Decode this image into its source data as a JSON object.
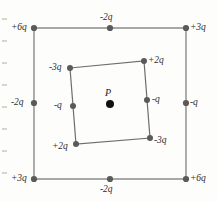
{
  "figure": {
    "center_point_label": "P",
    "colors": {
      "line": "#8a8a8a",
      "inner_line": "#6e6e6e",
      "dot": "#5a5a5a",
      "center_dot": "#111111",
      "label": "#2e2e2e",
      "background": "#fdfdfc"
    },
    "outer_square": {
      "name": "outer-square",
      "charges": [
        {
          "id": "outer-top-left",
          "label": "+6q",
          "cx": 34,
          "cy": 28,
          "lx": 11,
          "ly": 23
        },
        {
          "id": "outer-top-mid",
          "label": "-2q",
          "cx": 110,
          "cy": 28,
          "lx": 100,
          "ly": 13
        },
        {
          "id": "outer-top-right",
          "label": "+3q",
          "cx": 186,
          "cy": 28,
          "lx": 190,
          "ly": 23
        },
        {
          "id": "outer-left-mid",
          "label": "-2q",
          "cx": 34,
          "cy": 103,
          "lx": 11,
          "ly": 98
        },
        {
          "id": "outer-right-mid",
          "label": "-q",
          "cx": 186,
          "cy": 103,
          "lx": 190,
          "ly": 98
        },
        {
          "id": "outer-bottom-left",
          "label": "+3q",
          "cx": 34,
          "cy": 179,
          "lx": 11,
          "ly": 174
        },
        {
          "id": "outer-bottom-mid",
          "label": "-2q",
          "cx": 110,
          "cy": 179,
          "lx": 100,
          "ly": 185
        },
        {
          "id": "outer-bottom-right",
          "label": "+6q",
          "cx": 186,
          "cy": 179,
          "lx": 190,
          "ly": 174
        }
      ]
    },
    "inner_square": {
      "name": "inner-square",
      "charges": [
        {
          "id": "inner-top-left",
          "label": "-3q",
          "cx": 70,
          "cy": 68,
          "lx": 49,
          "ly": 63
        },
        {
          "id": "inner-top-right",
          "label": "+2q",
          "cx": 144,
          "cy": 61,
          "lx": 148,
          "ly": 56
        },
        {
          "id": "inner-right-mid",
          "label": "-q",
          "cx": 147,
          "cy": 100,
          "lx": 152,
          "ly": 95
        },
        {
          "id": "inner-bottom-right",
          "label": "-3q",
          "cx": 150,
          "cy": 138,
          "lx": 154,
          "ly": 136
        },
        {
          "id": "inner-bottom-left",
          "label": "+2q",
          "cx": 76,
          "cy": 144,
          "lx": 52,
          "ly": 142
        },
        {
          "id": "inner-left-mid",
          "label": "-q",
          "cx": 73,
          "cy": 106,
          "lx": 54,
          "ly": 101
        }
      ]
    },
    "center": {
      "id": "field-point-P",
      "cx": 110,
      "cy": 104,
      "lx": 105,
      "ly": 88
    }
  }
}
